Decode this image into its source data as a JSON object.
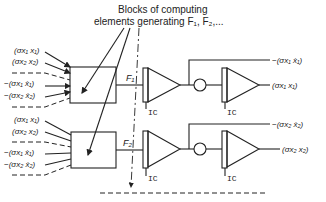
{
  "caption": {
    "line1": "Blocks of computing",
    "line2": "elements generating F₁, F₂,..."
  },
  "blocks": [
    {
      "output_label": "F₁",
      "inputs": [
        "(σx₁ x₁)",
        "(σx₂ x₂)",
        "−(σx₁ ẋ₁)",
        "−(σx₂ ẋ₂)"
      ],
      "integrator1_label": "IC",
      "integrator2_label": "IC",
      "output_velocity": "−(σx₁ ẋ₁)",
      "output_position": "(σx₁ x₁)"
    },
    {
      "output_label": "F₂",
      "inputs": [
        "(σx₁ x₁)",
        "(σx₂ x₂)",
        "−(σx₁ ẋ₁)",
        "−(σx₂ ẋ₂)"
      ],
      "integrator1_label": "IC",
      "integrator2_label": "IC",
      "output_velocity": "−(σx₂ ẋ₂)",
      "output_position": "(σx₂ x₂)"
    }
  ]
}
